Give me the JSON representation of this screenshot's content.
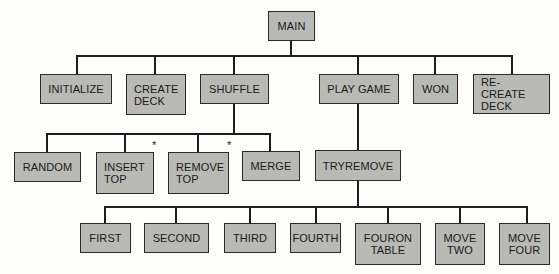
{
  "diagram": {
    "type": "structure-chart",
    "root": {
      "id": "main",
      "label": "MAIN"
    },
    "level1": [
      {
        "id": "initialize",
        "label": "INITIALIZE"
      },
      {
        "id": "create-deck",
        "label": "CREATE\nDECK"
      },
      {
        "id": "shuffle",
        "label": "SHUFFLE"
      },
      {
        "id": "play-game",
        "label": "PLAY GAME"
      },
      {
        "id": "won",
        "label": "WON"
      },
      {
        "id": "re-create-deck",
        "label": "RE-CREATE\nDECK"
      }
    ],
    "shuffle_children": [
      {
        "id": "random",
        "label": "RANDOM"
      },
      {
        "id": "insert-top",
        "label": "INSERT\nTOP",
        "marker": "*"
      },
      {
        "id": "remove-top",
        "label": "REMOVE\nTOP",
        "marker": "*"
      },
      {
        "id": "merge",
        "label": "MERGE"
      }
    ],
    "play_game_children": [
      {
        "id": "tryremove",
        "label": "TRYREMOVE"
      }
    ],
    "tryremove_children": [
      {
        "id": "first",
        "label": "FIRST"
      },
      {
        "id": "second",
        "label": "SECOND"
      },
      {
        "id": "third",
        "label": "THIRD"
      },
      {
        "id": "fourth",
        "label": "FOURTH"
      },
      {
        "id": "fouron-table",
        "label": "FOURON\nTABLE"
      },
      {
        "id": "move-two",
        "label": "MOVE\nTWO"
      },
      {
        "id": "move-four",
        "label": "MOVE\nFOUR"
      }
    ],
    "edges": [
      [
        "MAIN",
        "INITIALIZE"
      ],
      [
        "MAIN",
        "CREATE DECK"
      ],
      [
        "MAIN",
        "SHUFFLE"
      ],
      [
        "MAIN",
        "PLAY GAME"
      ],
      [
        "MAIN",
        "WON"
      ],
      [
        "MAIN",
        "RE-CREATE DECK"
      ],
      [
        "SHUFFLE",
        "RANDOM"
      ],
      [
        "SHUFFLE",
        "INSERT TOP"
      ],
      [
        "SHUFFLE",
        "REMOVE TOP"
      ],
      [
        "SHUFFLE",
        "MERGE"
      ],
      [
        "PLAY GAME",
        "TRYREMOVE"
      ],
      [
        "TRYREMOVE",
        "FIRST"
      ],
      [
        "TRYREMOVE",
        "SECOND"
      ],
      [
        "TRYREMOVE",
        "THIRD"
      ],
      [
        "TRYREMOVE",
        "FOURTH"
      ],
      [
        "TRYREMOVE",
        "FOURON TABLE"
      ],
      [
        "TRYREMOVE",
        "MOVE TWO"
      ],
      [
        "TRYREMOVE",
        "MOVE FOUR"
      ]
    ],
    "colors": {
      "box_fill": "#b9b9b6",
      "box_border": "#2a2a2a",
      "line": "#1e1e1e",
      "background": "#fdfdfb"
    }
  }
}
